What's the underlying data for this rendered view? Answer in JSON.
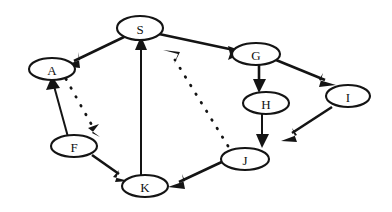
{
  "figure": {
    "type": "directed-graph-diagram",
    "title": "",
    "background_color": "#ffffff",
    "stroke_color": "#141414",
    "width": 392,
    "height": 212
  },
  "nodes": [
    {
      "id": "S",
      "label": "S",
      "cx": 140,
      "cy": 28,
      "rx": 23,
      "ry": 12
    },
    {
      "id": "A",
      "label": "A",
      "cx": 52,
      "cy": 69,
      "rx": 23,
      "ry": 11
    },
    {
      "id": "G",
      "label": "G",
      "cx": 256,
      "cy": 54,
      "rx": 24,
      "ry": 11
    },
    {
      "id": "I",
      "label": "I",
      "cx": 348,
      "cy": 96,
      "rx": 22,
      "ry": 11
    },
    {
      "id": "H",
      "label": "H",
      "cx": 266,
      "cy": 103,
      "rx": 23,
      "ry": 11
    },
    {
      "id": "F",
      "label": "F",
      "cx": 74,
      "cy": 146,
      "rx": 23,
      "ry": 11
    },
    {
      "id": "J",
      "label": "J",
      "cx": 245,
      "cy": 159,
      "rx": 24,
      "ry": 11
    },
    {
      "id": "K",
      "label": "K",
      "cx": 145,
      "cy": 186,
      "rx": 23,
      "ry": 11
    }
  ],
  "edges": [
    {
      "id": "S-A",
      "from": "S",
      "to": "A",
      "style": "solid",
      "arrow": "target"
    },
    {
      "id": "S-G",
      "from": "S",
      "to": "G",
      "style": "solid",
      "arrow": "target"
    },
    {
      "id": "K-S",
      "from": "K",
      "to": "S",
      "style": "solid",
      "arrow": "target"
    },
    {
      "id": "A-F",
      "from": "A",
      "to": "F",
      "style": "dotted",
      "arrow": "target"
    },
    {
      "id": "F-A",
      "from": "F",
      "to": "A",
      "style": "solid",
      "arrow": "target"
    },
    {
      "id": "F-K",
      "from": "F",
      "to": "K",
      "style": "solid",
      "arrow": "target"
    },
    {
      "id": "G-H",
      "from": "G",
      "to": "H",
      "style": "solid",
      "arrow": "target"
    },
    {
      "id": "G-I",
      "from": "G",
      "to": "I",
      "style": "solid",
      "arrow": "target"
    },
    {
      "id": "H-J",
      "from": "H",
      "to": "J",
      "style": "solid",
      "arrow": "target"
    },
    {
      "id": "I-J",
      "from": "I",
      "to": "J",
      "style": "solid",
      "arrow": "target"
    },
    {
      "id": "J-K",
      "from": "J",
      "to": "K",
      "style": "solid",
      "arrow": "target"
    },
    {
      "id": "J-S",
      "from": "J",
      "to": "S",
      "style": "dotted",
      "arrow": "target"
    }
  ],
  "labels": {
    "S": "S",
    "A": "A",
    "G": "G",
    "I": "I",
    "H": "H",
    "F": "F",
    "J": "J",
    "K": "K"
  }
}
